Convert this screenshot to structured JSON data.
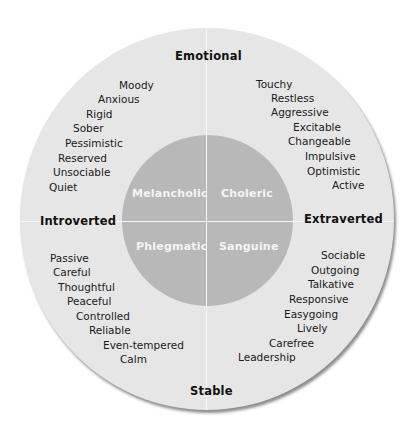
{
  "axes": {
    "top": "Emotional",
    "bottom": "Stable",
    "left": "Introverted",
    "right": "Extraverted"
  },
  "temperaments": {
    "top_left": "Melancholic",
    "top_right": "Choleric",
    "bottom_left": "Phlegmatic",
    "bottom_right": "Sanguine"
  },
  "traits": {
    "top_left": [
      "Moody",
      "Anxious",
      "Rigid",
      "Sober",
      "Pessimistic",
      "Reserved",
      "Unsociable",
      "Quiet"
    ],
    "top_right": [
      "Touchy",
      "Restless",
      "Aggressive",
      "Excitable",
      "Changeable",
      "Impulsive",
      "Optimistic",
      "Active"
    ],
    "bottom_left": [
      "Passive",
      "Careful",
      "Thoughtful",
      "Peaceful",
      "Controlled",
      "Reliable",
      "Even-tempered",
      "Calm"
    ],
    "bottom_right": [
      "Sociable",
      "Outgoing",
      "Talkative",
      "Responsive",
      "Easygoing",
      "Lively",
      "Carefree",
      "Leadership"
    ]
  },
  "colors": {
    "outer_ring": "#e6e6e6",
    "inner_circle": "#b8b8b8",
    "divider": "#f6f6f6",
    "inner_text": "#f4f4f4",
    "label_text": "#111111"
  }
}
